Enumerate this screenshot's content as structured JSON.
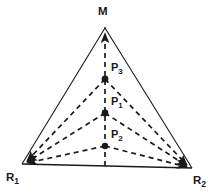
{
  "figure": {
    "type": "geometric-diagram",
    "background_color": "#ffffff",
    "line_color": "#1a1a1a",
    "dash_color": "#1a1a1a",
    "label_color": "#1a1a1a"
  },
  "vertices": [
    {
      "id": "M",
      "base": "M",
      "sub": "",
      "x": 105,
      "y": 28,
      "label_x": 98,
      "label_y": 6,
      "kind": "apex"
    },
    {
      "id": "R1",
      "base": "R",
      "sub": "1",
      "x": 22,
      "y": 164,
      "label_x": 6,
      "label_y": 172,
      "kind": "base-left"
    },
    {
      "id": "R2",
      "base": "R",
      "sub": "2",
      "x": 192,
      "y": 168,
      "label_x": 193,
      "label_y": 175,
      "kind": "base-right"
    }
  ],
  "points": [
    {
      "id": "P3",
      "base": "P",
      "sub": "3",
      "x": 105,
      "y": 79,
      "label_x": 111,
      "label_y": 62,
      "marker": "dot"
    },
    {
      "id": "P1",
      "base": "P",
      "sub": "1",
      "x": 105,
      "y": 113,
      "label_x": 111,
      "label_y": 96,
      "marker": "dot"
    },
    {
      "id": "P2",
      "base": "P",
      "sub": "2",
      "x": 105,
      "y": 146,
      "label_x": 111,
      "label_y": 129,
      "marker": "star"
    }
  ],
  "edges": {
    "solid": [
      {
        "name": "left-edge",
        "from": "R1",
        "to": "M"
      },
      {
        "name": "right-edge",
        "from": "M",
        "to": "R2"
      },
      {
        "name": "base-edge",
        "from": "R1",
        "to": "R2"
      }
    ],
    "dashed": [
      {
        "name": "median-M-to-base",
        "from": "M",
        "to": "base-midpoint",
        "arrow": "up"
      },
      {
        "name": "P3-to-R1",
        "from": "P3",
        "to": "R1",
        "arrow": "end"
      },
      {
        "name": "P3-to-R2",
        "from": "P3",
        "to": "R2",
        "arrow": "end"
      },
      {
        "name": "P1-to-R1",
        "from": "P1",
        "to": "R1",
        "arrow": "end"
      },
      {
        "name": "P1-to-R2",
        "from": "P1",
        "to": "R2",
        "arrow": "end"
      },
      {
        "name": "P2-to-R1",
        "from": "P2",
        "to": "R1",
        "arrow": "end"
      },
      {
        "name": "P2-to-R2",
        "from": "P2",
        "to": "R2",
        "arrow": "end"
      }
    ]
  },
  "labels": {
    "M": {
      "text": "M",
      "sub": ""
    },
    "P3": {
      "text": "P",
      "sub": "3"
    },
    "P1": {
      "text": "P",
      "sub": "1"
    },
    "P2": {
      "text": "P",
      "sub": "2"
    },
    "R1": {
      "text": "R",
      "sub": "1"
    },
    "R2": {
      "text": "R",
      "sub": "2"
    }
  }
}
